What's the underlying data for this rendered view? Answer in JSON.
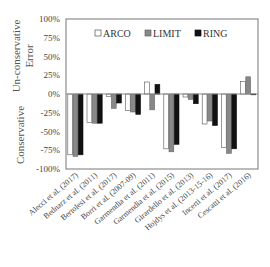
{
  "chart_data": {
    "type": "bar",
    "title": "",
    "xlabel": "",
    "ylabel_top": "Un-conservative Error",
    "ylabel_bottom": "Conservative",
    "ylim": [
      -100,
      100
    ],
    "yticks": [
      100,
      75,
      50,
      25,
      0,
      -25,
      -50,
      -75,
      -100
    ],
    "ytick_labels": [
      "100%",
      "75%",
      "50%",
      "25%",
      "0%",
      "-25%",
      "-50%",
      "-75%",
      "-100%"
    ],
    "grid": false,
    "legend_position": "top-inside",
    "categories": [
      "Alecci et al. (2017)",
      "Bednarz et al. (2011)",
      "Bertolesi et al. (2017)",
      "Borri et al. (2007-09)",
      "Garmendia et al. (2011)",
      "Garmendia et al. (2015)",
      "Girardello et al. (2013)",
      "Hojdys et al. (2013-15-16)",
      "Incerti et al. (2017)",
      "Cescatti et al. (2016)"
    ],
    "series": [
      {
        "name": "ARCO",
        "color": "#ffffff",
        "stroke": "#555555",
        "values": [
          -81,
          -38,
          -3,
          -22,
          16,
          -73,
          -4,
          -40,
          -71,
          17
        ]
      },
      {
        "name": "LIMIT",
        "color": "#888888",
        "stroke": "#666666",
        "values": [
          -83,
          -39,
          -19,
          -24,
          -21,
          -77,
          -7,
          -36,
          -79,
          23
        ]
      },
      {
        "name": "RING",
        "color": "#111111",
        "stroke": "#111111",
        "values": [
          -81,
          -39,
          -12,
          -27,
          13,
          -67,
          -13,
          -42,
          -73,
          -1
        ]
      }
    ]
  }
}
